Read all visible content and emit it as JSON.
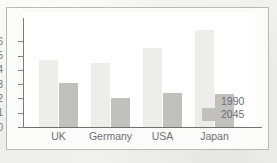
{
  "chart_data": {
    "type": "bar",
    "title": "",
    "xlabel": "",
    "ylabel": "",
    "categories": [
      "UK",
      "Germany",
      "USA",
      "Japan"
    ],
    "series": [
      {
        "name": "1990",
        "color": "#ededeb",
        "values": [
          4.7,
          4.5,
          5.5,
          6.8
        ]
      },
      {
        "name": "2045",
        "color": "#c0c0be",
        "values": [
          3.1,
          2.0,
          2.4,
          2.3
        ]
      }
    ],
    "ylim": [
      0,
      7
    ],
    "yticks": [
      0,
      1,
      2,
      3,
      4,
      5,
      6
    ],
    "ytick_labels": [
      "0",
      "1",
      "2",
      "3",
      "4",
      "5",
      "6"
    ],
    "grid": false,
    "legend_position": "right-inside",
    "legend_entries": [
      "1990",
      "2045"
    ]
  },
  "figure": {
    "background_color": "#f2f2f0",
    "plot_background_color": "#ffffff",
    "frame_color": "#b9b9b6",
    "axis_color": "#6f6f6d",
    "text_color": "#6e6e70"
  }
}
